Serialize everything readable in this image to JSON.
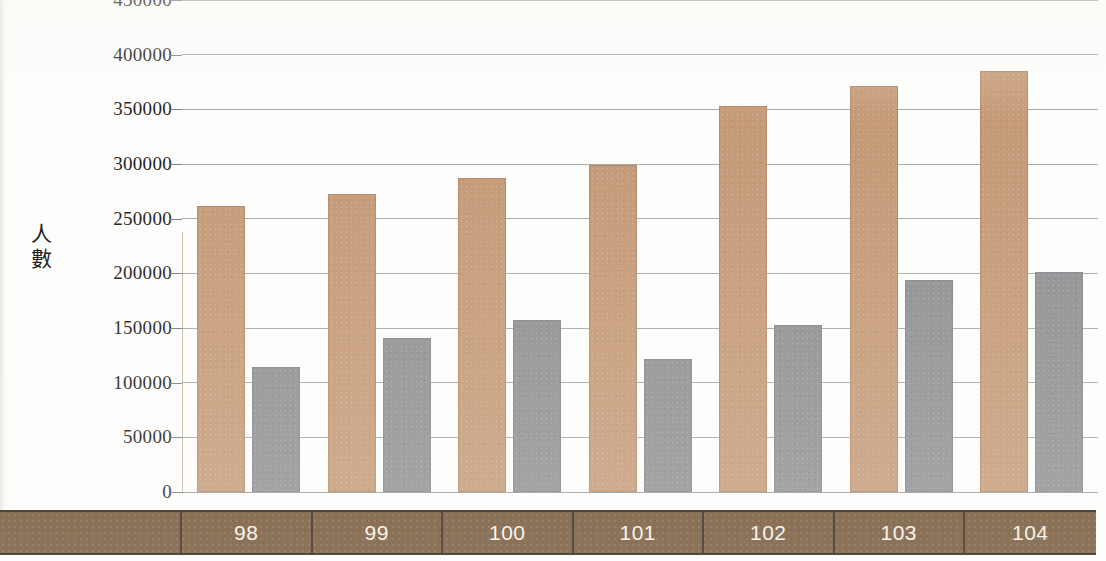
{
  "chart_data": {
    "type": "bar",
    "title": "",
    "xlabel": "",
    "ylabel": "人數",
    "categories": [
      "98",
      "99",
      "100",
      "101",
      "102",
      "103",
      "104"
    ],
    "series": [
      {
        "name": "series-a",
        "color": "#c49a77",
        "values": [
          262000,
          273000,
          287000,
          299000,
          353000,
          371000,
          385000
        ]
      },
      {
        "name": "series-b",
        "color": "#8f9092",
        "values": [
          114000,
          141000,
          157000,
          122000,
          153000,
          194000,
          201000
        ]
      }
    ],
    "ylim": [
      0,
      450000
    ],
    "ytick_values": [
      0,
      50000,
      100000,
      150000,
      200000,
      250000,
      300000,
      350000,
      400000,
      450000
    ],
    "ytick_labels": [
      "0",
      "50000",
      "100000",
      "150000",
      "200000",
      "250000",
      "300000",
      "350000",
      "400000",
      "450000"
    ],
    "grid": true,
    "legend": "none",
    "row_label": ""
  },
  "axis": {
    "y_title_chars": [
      "人",
      "數"
    ]
  },
  "colors": {
    "series_a": "#c49a77",
    "series_b": "#8f9092",
    "category_band": "#6d4f30",
    "category_text": "#f6f1e8",
    "gridline": "#9a9a9a",
    "tick_text": "#1a1a1a"
  }
}
